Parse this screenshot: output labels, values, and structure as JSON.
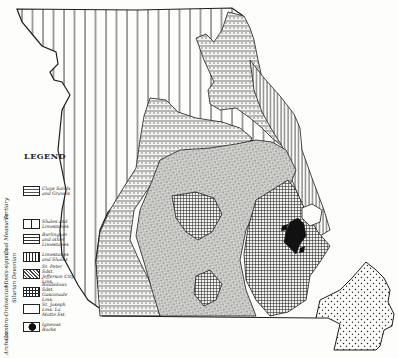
{
  "map": {
    "title": "Geological map of Missouri",
    "colors": {
      "ink": "#1e1e1e",
      "paper": "#fdfdfb"
    }
  },
  "legend": {
    "title": "LEGEND",
    "eras": [
      {
        "name": "Tertiary"
      },
      {
        "name": "Coal Measures"
      },
      {
        "name": "Missis-sippian"
      },
      {
        "name": "Silurian Devonian"
      },
      {
        "name": "Cambro-Ordovician"
      },
      {
        "name": "Archean"
      }
    ],
    "items": [
      {
        "label": "Clays Sands and Gravels",
        "pattern": "dots",
        "era": "Tertiary"
      },
      {
        "label": "Shales and Limestones",
        "pattern": "vertical-lines",
        "era": "Coal Measures"
      },
      {
        "label": "Burlington and other Limestones",
        "pattern": "dashed-horizontal",
        "era": "Mississippian"
      },
      {
        "label": "Limestones and Shales",
        "pattern": "vertical-dense",
        "era": "Silurian Devonian"
      },
      {
        "label": "St. Peter Sdst. Jefferson City Lms.",
        "pattern": "diagonal-stipple",
        "era": "Cambro-Ordovician"
      },
      {
        "label": "Roubidoux Sdst. Gasconade Lms.",
        "pattern": "grid",
        "era": "Cambro-Ordovician"
      },
      {
        "label": "St. Joseph Lms. La Motte Sst.",
        "pattern": "blank",
        "era": "Cambro-Ordovician"
      },
      {
        "label": "Igneous Rocks",
        "pattern": "solid-black",
        "era": "Archean"
      }
    ]
  }
}
